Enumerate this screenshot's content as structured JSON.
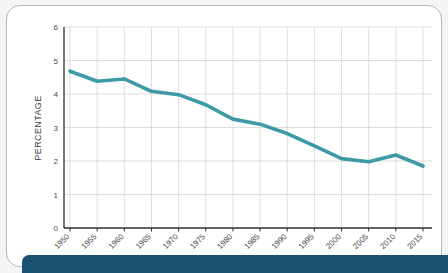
{
  "card": {
    "background_color": "#ffffff",
    "border_color": "#b9b9b9"
  },
  "bottom_bar": {
    "color": "#1a5072"
  },
  "chart_data": {
    "type": "line",
    "title": "",
    "xlabel": "",
    "ylabel": "PERCENTAGE",
    "x": [
      1950,
      1955,
      1960,
      1965,
      1970,
      1975,
      1980,
      1985,
      1990,
      1995,
      2000,
      2005,
      2010,
      2015
    ],
    "categories": [
      "1950",
      "1955",
      "1960",
      "1965",
      "1970",
      "1975",
      "1980",
      "1985",
      "1990",
      "1995",
      "2000",
      "2005",
      "2010",
      "2015"
    ],
    "values": [
      4.68,
      4.38,
      4.45,
      4.08,
      3.98,
      3.68,
      3.25,
      3.1,
      2.82,
      2.45,
      2.07,
      1.98,
      2.18,
      1.85
    ],
    "series": [
      {
        "name": "Percentage",
        "color": "#3e9aa6",
        "values": [
          4.68,
          4.38,
          4.45,
          4.08,
          3.98,
          3.68,
          3.25,
          3.1,
          2.82,
          2.45,
          2.07,
          1.98,
          2.18,
          1.85
        ]
      }
    ],
    "ylim": [
      0,
      6
    ],
    "yticks": [
      0,
      1,
      2,
      3,
      4,
      5,
      6
    ],
    "ytick_labels": [
      "0",
      "1",
      "2",
      "3",
      "4",
      "5",
      "6"
    ],
    "xlim": [
      1950,
      2015
    ],
    "grid": true,
    "grid_color": "#cfcfcf",
    "legend": "none",
    "line_color": "#3e9aa6",
    "line_width": 3.6,
    "xtick_rotation": -45
  }
}
